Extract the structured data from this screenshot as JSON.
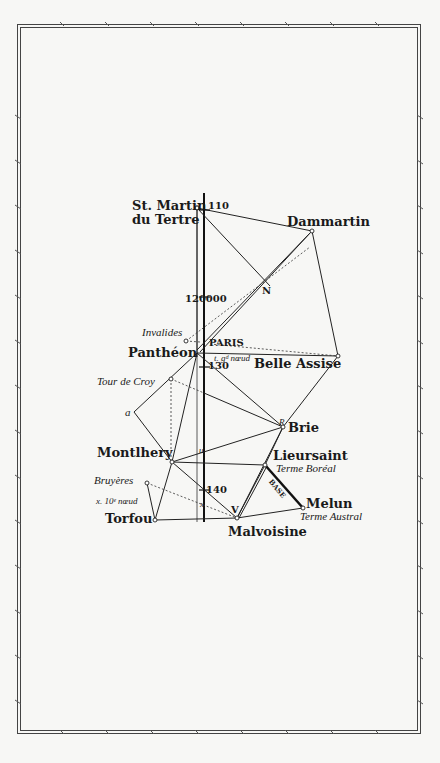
{
  "stations": {
    "st_martin_1": "St. Martin",
    "st_martin_2": "du Tertre",
    "dammartin": "Dammartin",
    "invalides": "Invalides",
    "pantheon": "Panthéon",
    "paris": "PARIS",
    "belle_assise": "Belle Assise",
    "tour_de_croy": "Tour de Croy",
    "brie": "Brie",
    "montlhery": "Montlhery",
    "lieursaint": "Lieursaint",
    "terme_boreal": "Terme Boréal",
    "bruyeres": "Bruyères",
    "melun": "Melun",
    "terme_austral": "Terme Austral",
    "torfou": "Torfou",
    "malvoisine": "Malvoisine"
  },
  "annotations": {
    "mark_110": "110",
    "mark_120": "120000",
    "mark_130": "130",
    "mark_140": "140",
    "point_N": "N",
    "point_a": "a",
    "point_R": "R",
    "point_u": "u",
    "point_V": "V",
    "point_x": "x",
    "point_r": "r",
    "point_y": "y",
    "first_node": "t. gᵈ nœud",
    "tenth_node": "x. 10ᵉ nœud",
    "base": "BASE"
  }
}
